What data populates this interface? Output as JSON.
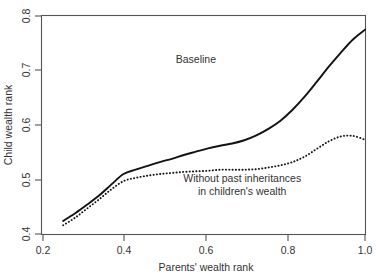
{
  "chart_data": {
    "type": "line",
    "title": "",
    "xlabel": "Parents' wealth rank",
    "ylabel": "Child wealth rank",
    "xlim": [
      0.2,
      1.0
    ],
    "ylim": [
      0.4,
      0.8
    ],
    "xticks": [
      "0.2",
      "0.4",
      "0.6",
      "0.8",
      "1.0"
    ],
    "xtick_values": [
      0.2,
      0.4,
      0.6,
      0.8,
      1.0
    ],
    "yticks": [
      "0.4",
      "0.5",
      "0.6",
      "0.7",
      "0.8"
    ],
    "ytick_values": [
      0.4,
      0.5,
      0.6,
      0.7,
      0.8
    ],
    "grid": false,
    "legend_position": "inline-annotation",
    "x": [
      0.25,
      0.28,
      0.31,
      0.34,
      0.37,
      0.4,
      0.43,
      0.46,
      0.49,
      0.52,
      0.55,
      0.58,
      0.61,
      0.64,
      0.67,
      0.7,
      0.73,
      0.76,
      0.79,
      0.82,
      0.85,
      0.88,
      0.91,
      0.94,
      0.97,
      1.0
    ],
    "series": [
      {
        "name": "Baseline",
        "style": "solid",
        "color": "#121212",
        "values": [
          0.424,
          0.438,
          0.454,
          0.471,
          0.491,
          0.51,
          0.518,
          0.525,
          0.532,
          0.538,
          0.545,
          0.551,
          0.557,
          0.562,
          0.566,
          0.572,
          0.581,
          0.593,
          0.608,
          0.628,
          0.652,
          0.679,
          0.707,
          0.733,
          0.757,
          0.775
        ]
      },
      {
        "name": "Without past inheritances in children's wealth",
        "style": "dotted",
        "color": "#121212",
        "values": [
          0.416,
          0.43,
          0.447,
          0.464,
          0.482,
          0.497,
          0.503,
          0.507,
          0.51,
          0.512,
          0.514,
          0.515,
          0.516,
          0.518,
          0.518,
          0.518,
          0.519,
          0.522,
          0.526,
          0.532,
          0.542,
          0.556,
          0.57,
          0.579,
          0.58,
          0.573
        ]
      }
    ],
    "annotations": [
      {
        "text": "Baseline",
        "x": 0.58,
        "y": 0.713
      },
      {
        "text": "Without past inheritances",
        "x": 0.695,
        "y": 0.496
      },
      {
        "text": "in children's wealth",
        "x": 0.695,
        "y": 0.471
      }
    ]
  }
}
